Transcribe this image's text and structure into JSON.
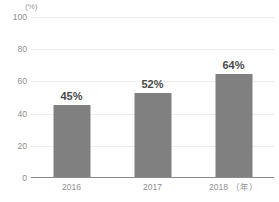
{
  "chart_data": {
    "type": "bar",
    "title": "Sustainable Products",
    "subtitle": "",
    "xlabel": "",
    "ylabel": "",
    "unit_label": "(%)",
    "x_axis_unit": "（年）",
    "categories": [
      "2016",
      "2017",
      "2018"
    ],
    "values": [
      45,
      52,
      64
    ],
    "data_labels": [
      "45%",
      "52%",
      "64%"
    ],
    "ylim": [
      0,
      100
    ],
    "y_ticks": [
      100,
      80,
      60,
      40,
      20,
      0
    ],
    "y_tick_labels": [
      "100",
      "80",
      "60",
      "40",
      "20",
      "0"
    ],
    "grid": true,
    "legend": "none",
    "series": [
      {
        "name": "Sustainable Products",
        "values": [
          45,
          52,
          64
        ]
      }
    ],
    "colors": {
      "bar": "#808080",
      "gridline": "#ececec",
      "axis": "#8a8a8a",
      "tick_text": "#8f8f8f",
      "label_text": "#4a4a4a",
      "title_text": "#4d4d4d",
      "background": "#ffffff"
    }
  }
}
